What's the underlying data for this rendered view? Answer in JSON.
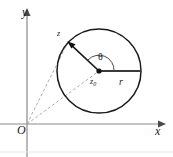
{
  "figure": {
    "width": 173,
    "height": 157,
    "background": "#ffffff"
  },
  "axes": {
    "y_label": "y",
    "x_label": "x",
    "origin_label": "O",
    "axis_color": "#808080",
    "x_axis_y": 124,
    "y_axis_x": 27,
    "x_arrow_tip_x": 160,
    "y_arrow_tip_y": 12
  },
  "circle": {
    "center_x": 99,
    "center_y": 71,
    "radius": 42,
    "stroke": "#1a1a1a",
    "stroke_width": 1.4,
    "fill": "none"
  },
  "labels": {
    "point_z": "z",
    "center_z0": "z",
    "center_z0_sub": "0",
    "angle_theta": "θ",
    "radius_r": "r"
  },
  "vectors": {
    "radius_to_z": {
      "from_x": 99,
      "from_y": 71,
      "to_x": 68,
      "to_y": 42,
      "color": "#1a1a1a",
      "style": "solid-arrow"
    },
    "radius_horizontal": {
      "from_x": 99,
      "from_y": 71,
      "to_x": 141,
      "to_y": 71,
      "color": "#404040",
      "style": "solid-thick"
    }
  },
  "dashed_lines": [
    {
      "name": "origin-to-z",
      "from_x": 27,
      "from_y": 124,
      "to_x": 68,
      "to_y": 42,
      "color": "#9a9a9a"
    },
    {
      "name": "origin-to-z0",
      "from_x": 27,
      "from_y": 124,
      "to_x": 99,
      "to_y": 71,
      "color": "#9a9a9a"
    }
  ],
  "angle_arc": {
    "name": "theta-arc",
    "center_x": 99,
    "center_y": 71,
    "radius": 15,
    "start_deg": 0,
    "end_deg": 137,
    "color": "#404040"
  }
}
